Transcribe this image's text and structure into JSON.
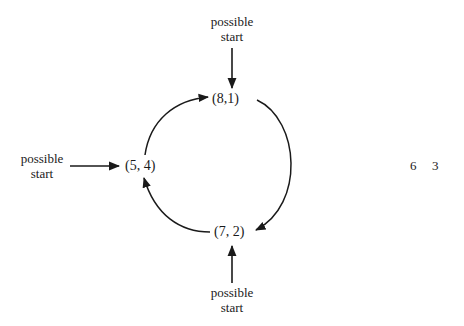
{
  "diagram": {
    "nodes": [
      {
        "id": "top",
        "label": "(8,1)"
      },
      {
        "id": "left",
        "label": "(5, 4)"
      },
      {
        "id": "bottom",
        "label": "(7, 2)"
      }
    ],
    "start_labels": {
      "top": {
        "line1": "possible",
        "line2": "start"
      },
      "left": {
        "line1": "possible",
        "line2": "start"
      },
      "bottom": {
        "line1": "possible",
        "line2": "start"
      }
    },
    "cycle_edges": [
      {
        "from": "(5, 4)",
        "to": "(8,1)"
      },
      {
        "from": "(8,1)",
        "to": "(7, 2)"
      },
      {
        "from": "(7, 2)",
        "to": "(5, 4)"
      }
    ],
    "side_numbers": {
      "a": "6",
      "b": "3"
    },
    "colors": {
      "stroke": "#1a1a1a",
      "background": "#ffffff"
    }
  }
}
